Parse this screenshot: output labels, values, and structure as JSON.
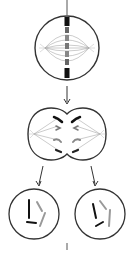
{
  "diagram": {
    "type": "cell-division",
    "stages": [
      {
        "id": "metaphase",
        "label": "",
        "description": "Cell with chromosomes aligned at equator and spindle fibers"
      },
      {
        "id": "anaphase-telophase",
        "label": "",
        "description": "Cell pinching into two with chromosomes pulled to poles"
      },
      {
        "id": "daughter-cells",
        "label": "",
        "description": "Two daughter cells each with chromosomes"
      }
    ],
    "colors": {
      "outline": "#333333",
      "chromosome_dark": "#111111",
      "chromosome_light": "#9a9a9a",
      "spindle": "#aaaaaa",
      "background": "#ffffff"
    }
  }
}
